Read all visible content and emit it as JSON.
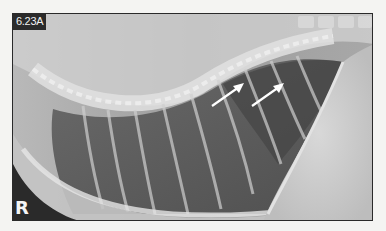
{
  "figure": {
    "label": "6.23A",
    "side_marker": "R",
    "annotations": [
      {
        "type": "arrow",
        "color": "#ffffff",
        "from": [
          199,
          92
        ],
        "to": [
          230,
          70
        ]
      },
      {
        "type": "arrow",
        "color": "#ffffff",
        "from": [
          239,
          92
        ],
        "to": [
          270,
          70
        ]
      }
    ],
    "colors": {
      "page_background": "#f4f4f2",
      "label_background": "#2b2b2b",
      "label_text": "#f2f2f2",
      "border": "#2a2a2a"
    }
  }
}
